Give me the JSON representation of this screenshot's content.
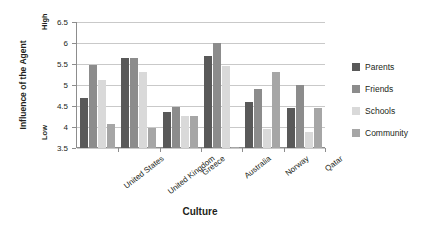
{
  "chart_data": {
    "type": "bar",
    "title": "",
    "xlabel": "Culture",
    "ylabel": "Influence of the Agent",
    "y_high_label": "High",
    "y_low_label": "Low",
    "ylim": [
      3.5,
      6.5
    ],
    "yticks": [
      3.5,
      4,
      4.5,
      5,
      5.5,
      6,
      6.5
    ],
    "ytick_labels": [
      "3.5",
      "4",
      "4.5",
      "5",
      "5.5",
      "6",
      "6.5"
    ],
    "grid": true,
    "legend_position": "right",
    "categories": [
      "United States",
      "United Kingdom",
      "Greece",
      "Australia",
      "Norway",
      "Qatar"
    ],
    "series": [
      {
        "name": "Parents",
        "color": "#595959",
        "values": [
          4.7,
          5.65,
          4.35,
          5.7,
          4.6,
          4.45
        ]
      },
      {
        "name": "Friends",
        "color": "#8c8c8c",
        "values": [
          5.47,
          5.65,
          4.47,
          6.0,
          4.9,
          5.0
        ]
      },
      {
        "name": "Schools",
        "color": "#d9d9d9",
        "values": [
          5.12,
          5.3,
          4.27,
          5.45,
          3.95,
          3.88
        ]
      },
      {
        "name": "Community",
        "color": "#a6a6a6",
        "values": [
          4.07,
          3.97,
          4.27,
          3.52,
          5.32,
          4.45
        ]
      }
    ]
  },
  "axis": {
    "y_title": "Influence of the Agent",
    "x_title": "Culture"
  }
}
